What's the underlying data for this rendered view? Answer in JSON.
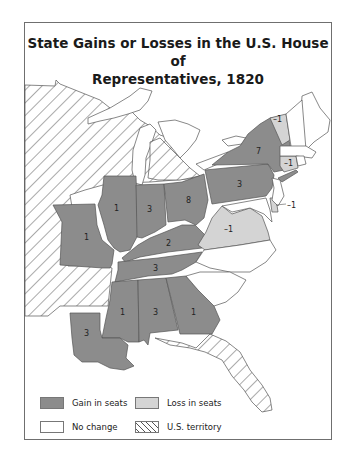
{
  "title": {
    "line1": "State Gains or Losses in the U.S. House of",
    "line2": "Representatives, 1820"
  },
  "colors": {
    "gain": "#8c8c8c",
    "loss": "#d4d4d4",
    "no_change": "#ffffff",
    "territory_hatch": "#555555",
    "border": "#555555"
  },
  "states": {
    "new_york": "7",
    "pennsylvania": "3",
    "ohio": "8",
    "indiana": "3",
    "illinois": "1",
    "missouri": "1",
    "kentucky": "2",
    "tennessee": "3",
    "mississippi": "1",
    "alabama": "3",
    "georgia": "1",
    "louisiana": "3",
    "virginia": "–1",
    "vermont": "–1",
    "connecticut": "–1",
    "delaware": "–1"
  },
  "legend": {
    "gain": "Gain in seats",
    "loss": "Loss in seats",
    "no_change": "No change",
    "territory": "U.S. territory"
  }
}
